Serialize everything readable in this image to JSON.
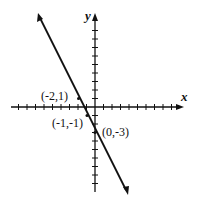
{
  "chart_data": {
    "type": "line",
    "title": "",
    "xlabel": "x",
    "ylabel": "y",
    "grid": false,
    "series": [
      {
        "name": "line",
        "equation": "y = -2x - 3",
        "points": [
          [
            -2,
            1
          ],
          [
            -1,
            -1
          ],
          [
            0,
            -3
          ]
        ]
      }
    ],
    "annotations": [
      "(-2,1)",
      "(-1,-1)",
      "(0,-3)"
    ],
    "xlim": [
      -10,
      10
    ],
    "ylim": [
      -10,
      10
    ]
  },
  "labels": {
    "x": "x",
    "y": "y",
    "p1": "(-2,1)",
    "p2": "(-1,-1)",
    "p3": "(0,-3)"
  }
}
